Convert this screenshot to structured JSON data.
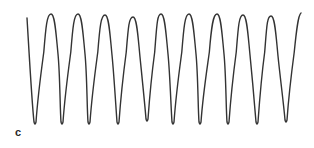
{
  "panel": {
    "label": "c"
  },
  "chart_data": {
    "type": "line",
    "title": "",
    "xlabel": "",
    "ylabel": "",
    "axes": "none",
    "grid": false,
    "legend": null,
    "line_color": "#333333",
    "cycles": 10,
    "peaks_px": [
      {
        "x": 51,
        "y": 14
      },
      {
        "x": 78,
        "y": 14
      },
      {
        "x": 105,
        "y": 15
      },
      {
        "x": 133,
        "y": 17
      },
      {
        "x": 161,
        "y": 14
      },
      {
        "x": 189,
        "y": 14
      },
      {
        "x": 217,
        "y": 14
      },
      {
        "x": 243,
        "y": 15
      },
      {
        "x": 271,
        "y": 16
      }
    ],
    "troughs_px": [
      {
        "x": 35,
        "y": 124
      },
      {
        "x": 62,
        "y": 124
      },
      {
        "x": 89,
        "y": 124
      },
      {
        "x": 118,
        "y": 124
      },
      {
        "x": 147,
        "y": 121
      },
      {
        "x": 173,
        "y": 124
      },
      {
        "x": 200,
        "y": 124
      },
      {
        "x": 228,
        "y": 124
      },
      {
        "x": 257,
        "y": 124
      },
      {
        "x": 286,
        "y": 122
      }
    ],
    "start_px": {
      "x": 27,
      "y": 18
    },
    "end_px": {
      "x": 301,
      "y": 13
    }
  }
}
